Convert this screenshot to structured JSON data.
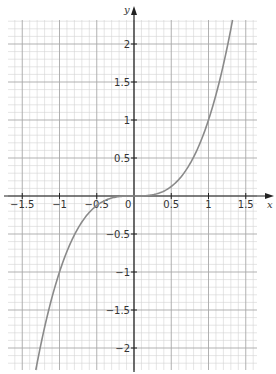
{
  "chart_data": {
    "type": "line",
    "title": "",
    "xlabel": "x",
    "ylabel": "y",
    "xlim": [
      -1.68,
      1.65
    ],
    "ylim": [
      -2.3,
      2.3
    ],
    "grid": true,
    "grid_minor_step": 0.1,
    "grid_major_step": 0.5,
    "x_ticks": [
      -1.5,
      -1,
      -0.5,
      0,
      0.5,
      1,
      1.5
    ],
    "x_tick_labels": [
      "−1.5",
      "−1",
      "−0.5",
      "0",
      "0.5",
      "1",
      "1.5"
    ],
    "y_ticks": [
      -2,
      -1.5,
      -1,
      -0.5,
      0.5,
      1,
      1.5,
      2
    ],
    "y_tick_labels": [
      "−2",
      "−1.5",
      "−1",
      "−0.5",
      "0.5",
      "1",
      "1.5",
      "2"
    ],
    "origin_label": "0",
    "series": [
      {
        "name": "y = x³",
        "function": "x^3",
        "x": [
          -1.32,
          -1.25,
          -1.0,
          -0.75,
          -0.5,
          -0.25,
          0,
          0.25,
          0.5,
          0.75,
          1.0,
          1.25,
          1.32
        ],
        "y": [
          -2.3,
          -1.95,
          -1.0,
          -0.42,
          -0.125,
          -0.016,
          0,
          0.016,
          0.125,
          0.42,
          1.0,
          1.95,
          2.3
        ],
        "color": "#8a8a8a"
      }
    ],
    "legend": null
  },
  "colors": {
    "minor_grid": "#d4d4d4",
    "major_grid": "#a8a8a8",
    "axis": "#222222",
    "curve": "#8a8a8a"
  }
}
